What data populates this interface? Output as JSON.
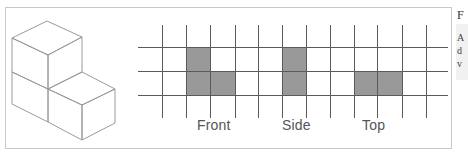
{
  "figure": {
    "views": [
      {
        "label": "Front",
        "shaded_cells": [
          [
            0,
            0
          ],
          [
            1,
            0
          ],
          [
            1,
            1
          ]
        ]
      },
      {
        "label": "Side",
        "shaded_cells": [
          [
            0,
            0
          ],
          [
            1,
            0
          ]
        ]
      },
      {
        "label": "Top",
        "shaded_cells": [
          [
            1,
            0
          ],
          [
            1,
            1
          ]
        ]
      }
    ],
    "colors": {
      "frame": "#c8c8c8",
      "grid_line": "#555555",
      "shade": "#999999",
      "cube_line": "#9a9a9a",
      "label_text": "#555555"
    }
  },
  "side_panel": {
    "heading": "F",
    "lines": [
      "A",
      "d",
      "v"
    ]
  }
}
